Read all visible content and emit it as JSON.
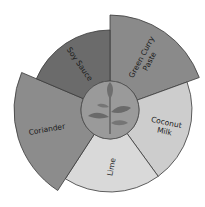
{
  "diagram": {
    "type": "sunburst-wheel",
    "center_icon": "plant-sprout-icon",
    "segments": [
      {
        "label_lines": [
          "Green Curry",
          "Paste"
        ],
        "color": "#8a8a8a",
        "emphasis": "extended"
      },
      {
        "label_lines": [
          "Coconut",
          "Milk"
        ],
        "color": "#cdcdcd",
        "emphasis": "normal"
      },
      {
        "label_lines": [
          "Lime"
        ],
        "color": "#d9d9d9",
        "emphasis": "normal"
      },
      {
        "label_lines": [
          "Coriander"
        ],
        "color": "#8c8c8c",
        "emphasis": "extended"
      },
      {
        "label_lines": [
          "Soy Sauce"
        ],
        "color": "#6b6b6b",
        "emphasis": "normal"
      }
    ],
    "center_color": "#9a9a9a",
    "outline_color": "#3a3a3a"
  }
}
